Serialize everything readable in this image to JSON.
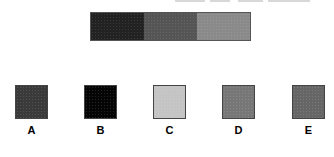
{
  "figure": {
    "strip": {
      "segments": [
        {
          "name": "dark",
          "color": "#222222"
        },
        {
          "name": "medium",
          "color": "#555555"
        },
        {
          "name": "light",
          "color": "#8a8a8a"
        }
      ]
    },
    "options": [
      {
        "label": "A",
        "color": "#3a3a3a",
        "left": 15
      },
      {
        "label": "B",
        "color": "#050505",
        "left": 84
      },
      {
        "label": "C",
        "color": "#c4c4c4",
        "left": 153
      },
      {
        "label": "D",
        "color": "#777777",
        "left": 222
      },
      {
        "label": "E",
        "color": "#666666",
        "left": 292
      }
    ]
  }
}
